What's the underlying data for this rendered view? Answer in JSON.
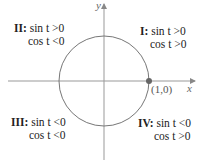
{
  "diagram": {
    "axes": {
      "x_label": "x",
      "y_label": "y"
    },
    "point": {
      "label": "(1,0)",
      "color": "#555555"
    },
    "colors": {
      "circle": "#666666",
      "axes": "#888888"
    },
    "quadrants": [
      {
        "id": "I",
        "roman": "I",
        "line1": "sin t >0",
        "line2": "cos t >0"
      },
      {
        "id": "II",
        "roman": "II",
        "line1": "sin t >0",
        "line2": "cos t <0"
      },
      {
        "id": "III",
        "roman": "III",
        "line1": "sin t <0",
        "line2": "cos t <0"
      },
      {
        "id": "IV",
        "roman": "IV",
        "line1": "sin t <0",
        "line2": "cos t >0"
      }
    ]
  }
}
